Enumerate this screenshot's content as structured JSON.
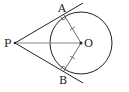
{
  "diagram": {
    "type": "geometry",
    "labels": {
      "P": "P",
      "O": "O",
      "A": "A",
      "B": "B"
    },
    "points": {
      "P": [
        15,
        43
      ],
      "O": [
        81,
        43
      ],
      "A": [
        64,
        15
      ],
      "B": [
        64,
        71
      ]
    },
    "circle": {
      "center": "O",
      "radius": 31
    },
    "segments": [
      "PA",
      "PB",
      "PO",
      "OA",
      "OB"
    ],
    "marks": {
      "right_angles": [
        "OAP",
        "OBP"
      ],
      "equal_ticks": [
        "OA",
        "OB"
      ]
    },
    "colors": {
      "stroke": "#222222",
      "center_segment": "#888888",
      "background": "#ffffff"
    }
  }
}
